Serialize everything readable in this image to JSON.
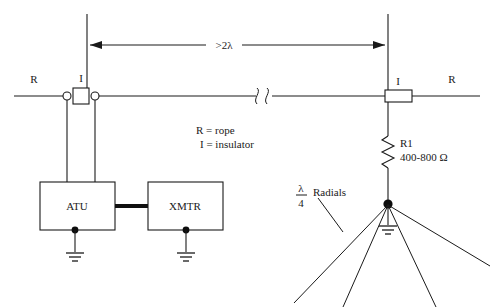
{
  "diagram": {
    "labels": {
      "rope_left": "R",
      "rope_right": "R",
      "insulator_left": "I",
      "insulator_right": "I",
      "dimension": ">2λ",
      "atu": "ATU",
      "xmtr": "XMTR",
      "resistor_ref": "R1",
      "resistor_value": "400-800 Ω",
      "radials": "Radials",
      "radial_length_numerator": "λ",
      "radial_length_denominator": "4"
    },
    "legend": [
      {
        "symbol": "R",
        "equals": "=",
        "meaning": "rope"
      },
      {
        "symbol": "I",
        "equals": "=",
        "meaning": "insulator"
      }
    ],
    "legend_lines": [
      "R = rope",
      "I = insulator"
    ],
    "colors": {
      "background": "#ffffff",
      "line": "#1a1a1a",
      "text": "#1a1a1a",
      "coax": "#101010"
    },
    "components": [
      {
        "name": "insulator-left",
        "type": "insulator",
        "label": "I"
      },
      {
        "name": "insulator-right",
        "type": "insulator",
        "label": "I"
      },
      {
        "name": "atu-box",
        "type": "box",
        "label": "ATU"
      },
      {
        "name": "xmtr-box",
        "type": "box",
        "label": "XMTR"
      },
      {
        "name": "resistor-r1",
        "type": "resistor",
        "label": "R1",
        "value": "400-800 Ω"
      },
      {
        "name": "radial-ground",
        "type": "ground"
      },
      {
        "name": "atu-ground",
        "type": "ground"
      },
      {
        "name": "xmtr-ground",
        "type": "ground"
      },
      {
        "name": "wire-break",
        "type": "break-symbol"
      }
    ],
    "radial_count": 4
  }
}
